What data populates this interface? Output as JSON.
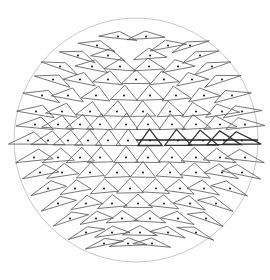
{
  "caption": "",
  "colors": {
    "background": "#ffffff",
    "circle": "#c8c8c8",
    "glyph": "#555555",
    "glyph_bold": "#333333",
    "dot": "#111111",
    "axis_line": "#222222"
  },
  "circle": {
    "cx": 136,
    "cy": 140,
    "r": 122
  },
  "axis_line": {
    "x1": 136,
    "y1": 140,
    "x2": 258,
    "y2": 140,
    "width": 1.6
  },
  "glyph_field": {
    "spacing": 21,
    "row_spacing": 19.5,
    "max_radius": 112,
    "size": 10.5
  },
  "rows": [
    {
      "y": 36,
      "xs": [
        118,
        146
      ]
    },
    {
      "y": 45,
      "xs": [
        97,
        168,
        190
      ]
    },
    {
      "y": 55,
      "xs": [
        78,
        108,
        150,
        200
      ]
    },
    {
      "y": 66,
      "xs": [
        60,
        92,
        120,
        149,
        178,
        212
      ]
    },
    {
      "y": 79,
      "xs": [
        53,
        80,
        108,
        136,
        164,
        192,
        222
      ]
    },
    {
      "y": 95,
      "xs": [
        42,
        68,
        96,
        124,
        150,
        176,
        204,
        232
      ]
    },
    {
      "y": 111,
      "xs": [
        36,
        62,
        90,
        117,
        143,
        170,
        196,
        222,
        242
      ]
    },
    {
      "y": 124,
      "xs": [
        35,
        58,
        80,
        100,
        126,
        148,
        172,
        196,
        220,
        245
      ]
    },
    {
      "y": 140,
      "xs": [
        28,
        48,
        68,
        88,
        108,
        128,
        150,
        178,
        203,
        224,
        242
      ]
    },
    {
      "y": 157,
      "xs": [
        34,
        58,
        80,
        100,
        126,
        148,
        172,
        196,
        220,
        245
      ]
    },
    {
      "y": 172,
      "xs": [
        40,
        62,
        90,
        117,
        143,
        170,
        196,
        222,
        242
      ]
    },
    {
      "y": 188,
      "xs": [
        48,
        75,
        104,
        130,
        156,
        180,
        204,
        230
      ]
    },
    {
      "y": 203,
      "xs": [
        58,
        86,
        112,
        138,
        164,
        190,
        216
      ]
    },
    {
      "y": 218,
      "xs": [
        70,
        96,
        122,
        150,
        178,
        206
      ]
    },
    {
      "y": 232,
      "xs": [
        86,
        112,
        140,
        168,
        196
      ]
    },
    {
      "y": 243,
      "xs": [
        104,
        128,
        152
      ]
    }
  ],
  "bold_row": {
    "y": 140,
    "from_x": 140
  }
}
